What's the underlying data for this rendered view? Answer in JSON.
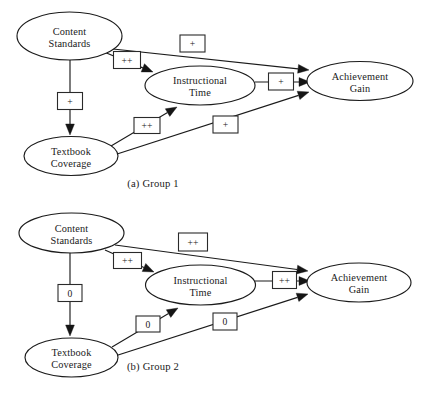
{
  "figure": {
    "background_color": "#ffffff",
    "ink_color": "#1a1a1a",
    "width": 436,
    "height": 398,
    "type": "path-diagram"
  },
  "panels": [
    {
      "id": "group-1",
      "caption": "(a) Group 1",
      "caption_x": 153,
      "caption_y": 187,
      "nodes": [
        {
          "id": "content-standards",
          "label_line1": "Content",
          "label_line2": "Standards",
          "cx": 69.5,
          "cy": 36,
          "rx": 52.5,
          "ry": 24
        },
        {
          "id": "instructional-time",
          "label_line1": "Instructional",
          "label_line2": "Time",
          "cx": 200,
          "cy": 85.5,
          "rx": 55,
          "ry": 19.5
        },
        {
          "id": "achievement-gain",
          "label_line1": "Achievement",
          "label_line2": "Gain",
          "cx": 360,
          "cy": 81,
          "rx": 53,
          "ry": 19.5
        },
        {
          "id": "textbook-coverage",
          "label_line1": "Textbook",
          "label_line2": "Coverage",
          "cx": 71,
          "cy": 156,
          "rx": 47,
          "ry": 19.5
        }
      ],
      "edges": [
        {
          "id": "cs-to-ag",
          "from": "content-standards",
          "to": "achievement-gain",
          "label": "+",
          "x1": 113,
          "y1": 49,
          "x2": 309,
          "y2": 70,
          "box_cx": 192.5,
          "box_cy": 43.5,
          "box_w": 25,
          "box_h": 17
        },
        {
          "id": "cs-to-it",
          "from": "content-standards",
          "to": "instructional-time",
          "label": "++",
          "x1": 104,
          "y1": 52,
          "x2": 153,
          "y2": 72,
          "box_cx": 127,
          "box_cy": 60,
          "box_w": 27,
          "box_h": 17
        },
        {
          "id": "cs-to-tc",
          "from": "content-standards",
          "to": "textbook-coverage",
          "label": "+",
          "x1": 70,
          "y1": 60,
          "x2": 70,
          "y2": 135,
          "box_cx": 70,
          "box_cy": 101,
          "box_w": 25,
          "box_h": 17
        },
        {
          "id": "it-to-ag",
          "from": "instructional-time",
          "to": "achievement-gain",
          "label": "+",
          "x1": 255,
          "y1": 82,
          "x2": 310,
          "y2": 82,
          "box_cx": 281,
          "box_cy": 81.5,
          "box_w": 25,
          "box_h": 17
        },
        {
          "id": "tc-to-it",
          "from": "textbook-coverage",
          "to": "instructional-time",
          "label": "++",
          "x1": 111,
          "y1": 146,
          "x2": 177,
          "y2": 107,
          "box_cx": 147,
          "box_cy": 125.5,
          "box_w": 26,
          "box_h": 16
        },
        {
          "id": "tc-to-ag",
          "from": "textbook-coverage",
          "to": "achievement-gain",
          "label": "+",
          "x1": 114,
          "y1": 155,
          "x2": 309,
          "y2": 92,
          "box_cx": 225.5,
          "box_cy": 124.5,
          "box_w": 25,
          "box_h": 17
        }
      ]
    },
    {
      "id": "group-2",
      "caption": "(b) Group 2",
      "caption_x": 153,
      "caption_y": 370,
      "nodes": [
        {
          "id": "content-standards",
          "label_line1": "Content",
          "label_line2": "Standards",
          "cx": 71.5,
          "cy": 233,
          "rx": 52.5,
          "ry": 20
        },
        {
          "id": "instructional-time",
          "label_line1": "Instructional",
          "label_line2": "Time",
          "cx": 200.5,
          "cy": 285,
          "rx": 55,
          "ry": 20
        },
        {
          "id": "achievement-gain",
          "label_line1": "Achievement",
          "label_line2": "Gain",
          "cx": 359,
          "cy": 282.5,
          "rx": 52,
          "ry": 19.5
        },
        {
          "id": "textbook-coverage",
          "label_line1": "Textbook",
          "label_line2": "Coverage",
          "cx": 71.5,
          "cy": 357.5,
          "rx": 46.5,
          "ry": 19.5
        }
      ],
      "edges": [
        {
          "id": "cs-to-ag",
          "from": "content-standards",
          "to": "achievement-gain",
          "label": "++",
          "x1": 115,
          "y1": 245,
          "x2": 308,
          "y2": 271,
          "box_cx": 193,
          "box_cy": 242,
          "box_w": 29,
          "box_h": 18
        },
        {
          "id": "cs-to-it",
          "from": "content-standards",
          "to": "instructional-time",
          "label": "++",
          "x1": 105,
          "y1": 250,
          "x2": 154,
          "y2": 272,
          "box_cx": 127.5,
          "box_cy": 260.5,
          "box_w": 28,
          "box_h": 16
        },
        {
          "id": "cs-to-tc",
          "from": "content-standards",
          "to": "textbook-coverage",
          "label": "0",
          "x1": 70,
          "y1": 253,
          "x2": 70,
          "y2": 336,
          "box_cx": 70,
          "box_cy": 293,
          "box_w": 24,
          "box_h": 17
        },
        {
          "id": "it-to-ag",
          "from": "instructional-time",
          "to": "achievement-gain",
          "label": "++",
          "x1": 255,
          "y1": 281,
          "x2": 310,
          "y2": 281,
          "box_cx": 284.5,
          "box_cy": 280,
          "box_w": 24,
          "box_h": 17
        },
        {
          "id": "tc-to-it",
          "from": "textbook-coverage",
          "to": "instructional-time",
          "label": "0",
          "x1": 112,
          "y1": 347,
          "x2": 178,
          "y2": 308,
          "box_cx": 148,
          "box_cy": 324,
          "box_w": 24,
          "box_h": 16
        },
        {
          "id": "tc-to-ag",
          "from": "textbook-coverage",
          "to": "achievement-gain",
          "label": "0",
          "x1": 115,
          "y1": 356,
          "x2": 308,
          "y2": 294,
          "box_cx": 225,
          "box_cy": 321.5,
          "box_w": 24,
          "box_h": 17
        }
      ]
    }
  ]
}
